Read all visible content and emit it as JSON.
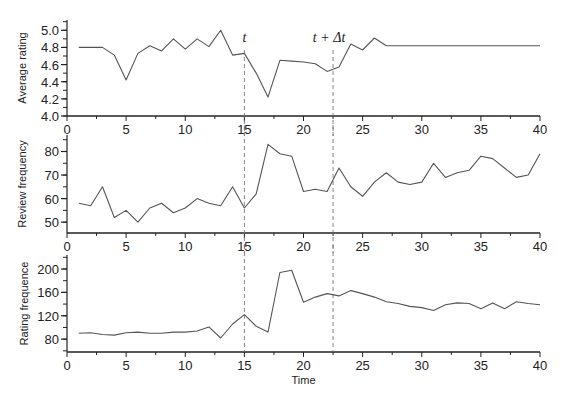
{
  "chart_data": [
    {
      "type": "line",
      "title": "",
      "xlabel": "",
      "ylabel": "Average rating",
      "xlim": [
        0,
        40
      ],
      "ylim": [
        4.0,
        5.0
      ],
      "xticks": [
        0,
        5,
        10,
        15,
        20,
        25,
        30,
        35,
        40
      ],
      "yticks": [
        "4.0",
        "4.2",
        "4.4",
        "4.6",
        "4.8",
        "5.0"
      ],
      "grid": false,
      "x": [
        1,
        2,
        3,
        4,
        5,
        6,
        7,
        8,
        9,
        10,
        11,
        12,
        13,
        14,
        15,
        16,
        17,
        18,
        19,
        20,
        21,
        22,
        23,
        24,
        25,
        26,
        27,
        28,
        29,
        30,
        31,
        32,
        33,
        34,
        35,
        36,
        37,
        38,
        39,
        40
      ],
      "values": [
        4.8,
        4.8,
        4.8,
        4.71,
        4.42,
        4.73,
        4.82,
        4.76,
        4.9,
        4.78,
        4.9,
        4.81,
        5.0,
        4.71,
        4.73,
        4.5,
        4.22,
        4.65,
        4.64,
        4.63,
        4.61,
        4.52,
        4.57,
        4.84,
        4.77,
        4.91,
        4.82,
        4.82,
        4.82,
        4.82,
        4.82,
        4.82,
        4.82,
        4.82,
        4.82,
        4.82,
        4.82,
        4.82,
        4.82,
        4.82
      ],
      "annotations": [
        {
          "text": "t",
          "x": 15
        },
        {
          "text": "t + Δt",
          "x": 22.5
        }
      ],
      "vlines": [
        15,
        22.5
      ]
    },
    {
      "type": "line",
      "title": "",
      "xlabel": "",
      "ylabel": "Review frequency",
      "xlim": [
        0,
        40
      ],
      "ylim": [
        45,
        85
      ],
      "xticks": [
        0,
        5,
        10,
        15,
        20,
        25,
        30,
        35,
        40
      ],
      "yticks": [
        "50",
        "60",
        "70",
        "80"
      ],
      "grid": false,
      "x": [
        1,
        2,
        3,
        4,
        5,
        6,
        7,
        8,
        9,
        10,
        11,
        12,
        13,
        14,
        15,
        16,
        17,
        18,
        19,
        20,
        21,
        22,
        23,
        24,
        25,
        26,
        27,
        28,
        29,
        30,
        31,
        32,
        33,
        34,
        35,
        36,
        37,
        38,
        39,
        40
      ],
      "values": [
        58,
        57,
        65,
        52,
        55,
        50,
        56,
        58,
        54,
        56,
        60,
        58,
        57,
        65,
        56,
        62,
        83,
        79,
        78,
        63,
        64,
        63,
        73,
        65,
        61,
        67,
        71,
        67,
        66,
        67,
        75,
        69,
        71,
        72,
        78,
        77,
        73,
        69,
        70,
        79
      ],
      "vlines": [
        15,
        22.5
      ]
    },
    {
      "type": "line",
      "title": "",
      "xlabel": "Time",
      "ylabel": "Rating frequence",
      "xlim": [
        0,
        40
      ],
      "ylim": [
        58,
        225
      ],
      "xticks": [
        0,
        5,
        10,
        15,
        20,
        25,
        30,
        35,
        40
      ],
      "yticks": [
        "80",
        "120",
        "160",
        "200"
      ],
      "grid": false,
      "x": [
        1,
        2,
        3,
        4,
        5,
        6,
        7,
        8,
        9,
        10,
        11,
        12,
        13,
        14,
        15,
        16,
        17,
        18,
        19,
        20,
        21,
        22,
        23,
        24,
        25,
        26,
        27,
        28,
        29,
        30,
        31,
        32,
        33,
        34,
        35,
        36,
        37,
        38,
        39,
        40
      ],
      "values": [
        90,
        91,
        88,
        87,
        91,
        92,
        90,
        90,
        92,
        92,
        94,
        101,
        82,
        106,
        122,
        102,
        92,
        194,
        198,
        143,
        152,
        158,
        154,
        163,
        158,
        152,
        144,
        141,
        136,
        134,
        129,
        139,
        142,
        141,
        132,
        142,
        132,
        144,
        141,
        139
      ],
      "vlines": [
        15,
        22.5
      ]
    }
  ]
}
